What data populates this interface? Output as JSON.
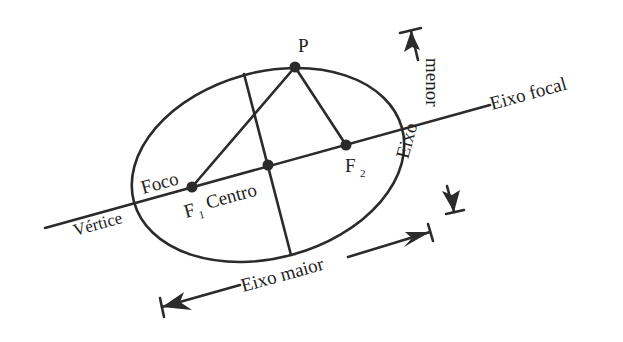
{
  "diagram": {
    "type": "ellipse-anatomy",
    "language": "pt",
    "colors": {
      "ink": "#2b2b2b",
      "background": "#ffffff"
    },
    "labels": {
      "point": "P",
      "focal_axis": "Eixo focal",
      "minor_axis_word1": "menor",
      "minor_axis_word2": "Eixo",
      "focus": "Foco",
      "focus1_letter": "F",
      "focus1_sub": "1",
      "focus2_letter": "F",
      "focus2_sub": "2",
      "center": "Centro",
      "vertex": "Vértice",
      "major_axis": "Eixo maior"
    },
    "points": [
      {
        "name": "P",
        "x": 295,
        "y": 67
      },
      {
        "name": "F1",
        "x": 192,
        "y": 187
      },
      {
        "name": "F2",
        "x": 346,
        "y": 145
      },
      {
        "name": "Centro",
        "x": 268,
        "y": 165
      }
    ],
    "segments": [
      {
        "name": "P-F1",
        "from": "P",
        "to": "F1"
      },
      {
        "name": "P-F2",
        "from": "P",
        "to": "F2"
      }
    ]
  }
}
